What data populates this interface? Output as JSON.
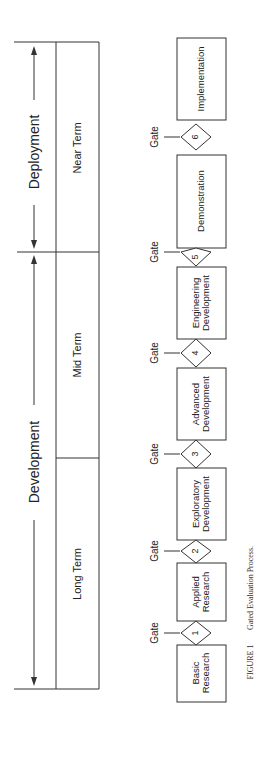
{
  "phases": {
    "development": "Development",
    "deployment": "Deployment"
  },
  "terms": [
    {
      "label": "Long Term"
    },
    {
      "label": "Mid Term"
    },
    {
      "label": "Near Term"
    }
  ],
  "stages": [
    {
      "label_line1": "Basic",
      "label_line2": "Research"
    },
    {
      "label_line1": "Applied",
      "label_line2": "Research"
    },
    {
      "label_line1": "Exploratory",
      "label_line2": "Development"
    },
    {
      "label_line1": "Advanced",
      "label_line2": "Development"
    },
    {
      "label_line1": "Engineering",
      "label_line2": "Development"
    },
    {
      "label_line1": "Demonstration",
      "label_line2": ""
    },
    {
      "label_line1": "Implementation",
      "label_line2": ""
    }
  ],
  "gates": [
    {
      "label": "Gate",
      "number": "1"
    },
    {
      "label": "Gate",
      "number": "2"
    },
    {
      "label": "Gate",
      "number": "3"
    },
    {
      "label": "Gate",
      "number": "4"
    },
    {
      "label": "Gate",
      "number": "5"
    },
    {
      "label": "Gate",
      "number": "6"
    }
  ],
  "caption": {
    "figure": "FIGURE 1",
    "title": "Gated Evaluation Process."
  }
}
